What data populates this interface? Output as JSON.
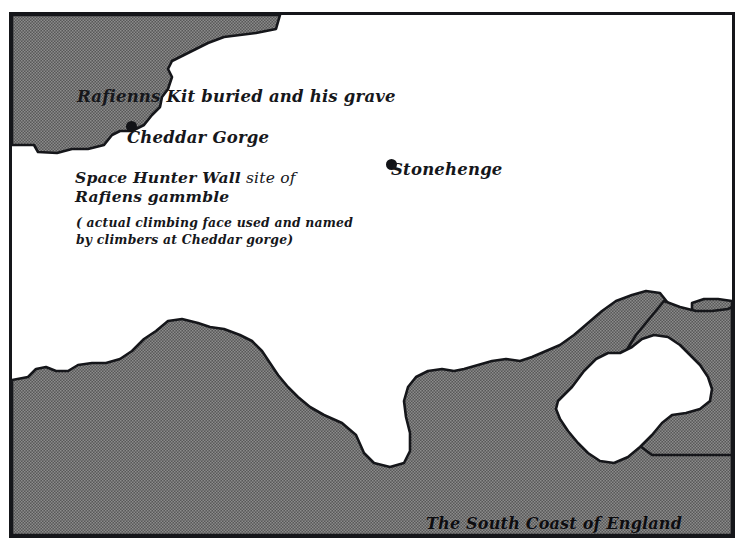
{
  "map": {
    "title": "The South Coast of England",
    "caption": "The South Coast of England",
    "colors": {
      "sea": "#6a6a6a",
      "land": "#ffffff",
      "ink": "#15161a",
      "marker": "#121317"
    },
    "annotations": [
      {
        "id": "rafienns-kit-grave",
        "text": "Rafienns Kit buried and his grave",
        "style": "script"
      },
      {
        "id": "cheddar-gorge",
        "text": "Cheddar Gorge",
        "style": "script"
      },
      {
        "id": "stonehenge",
        "text": "Stonehenge",
        "style": "script"
      },
      {
        "id": "space-hunter-wall",
        "text_bold": "Space Hunter Wall",
        "text_rest": " site of",
        "text_line2": "Rafiens gammble",
        "style": "script-bold"
      },
      {
        "id": "climbing-face-note",
        "line1": "( actual climbing face used and named",
        "line2": "by climbers at Cheddar gorge)",
        "style": "script-small"
      }
    ],
    "markers": [
      {
        "id": "cheddar-gorge-dot",
        "label": "Cheddar Gorge",
        "x": 120,
        "y": 112
      },
      {
        "id": "stonehenge-dot",
        "label": "Stonehenge",
        "x": 380,
        "y": 150
      }
    ],
    "features": {
      "bristol_channel": "sea inlet, upper left corner",
      "english_channel": "sea along the bottom edge",
      "isle_of_wight": "island enclosed by sea, lower right"
    }
  }
}
